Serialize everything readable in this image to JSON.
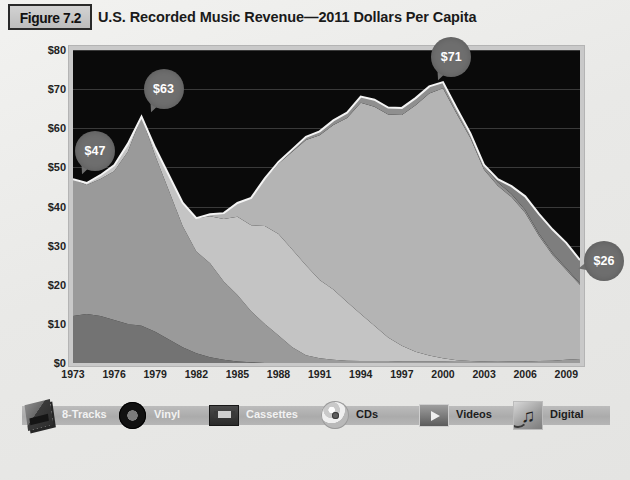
{
  "figure": {
    "badge": "Figure 7.2",
    "title": "U.S. Recorded Music Revenue—2011 Dollars Per Capita"
  },
  "colors": {
    "plot_background": "#0a0a0a",
    "gridline": "#3a3a3a",
    "callout": "#6e6e6e",
    "page_background": "#ebebeb",
    "eight_tracks": "#737373",
    "vinyl": "#9a9a9a",
    "cassettes": "#c4c4c4",
    "cds": "#b4b4b4",
    "videos": "#8f8f8f",
    "digital": "#7e7e7e"
  },
  "legend": {
    "items": [
      {
        "label": "8-Tracks",
        "icon": "eight-track-cartridge-icon",
        "dark": false
      },
      {
        "label": "Vinyl",
        "icon": "vinyl-record-icon",
        "dark": false
      },
      {
        "label": "Cassettes",
        "icon": "cassette-tape-icon",
        "dark": false
      },
      {
        "label": "CDs",
        "icon": "compact-disc-icon",
        "dark": true
      },
      {
        "label": "Videos",
        "icon": "video-play-icon",
        "dark": true
      },
      {
        "label": "Digital",
        "icon": "digital-music-note-icon",
        "dark": true
      }
    ]
  },
  "callouts": [
    {
      "label": "$47",
      "year": 1973,
      "value": 47,
      "tail": "tail-bl"
    },
    {
      "label": "$63",
      "year": 1978,
      "value": 63,
      "tail": "tail-bl"
    },
    {
      "label": "$71",
      "year": 1999,
      "value": 71,
      "tail": "tail-bl"
    },
    {
      "label": "$26",
      "year": 2010,
      "value": 26,
      "tail": "tail-l"
    }
  ],
  "chart_data": {
    "type": "area",
    "stacked": true,
    "title": "U.S. Recorded Music Revenue—2011 Dollars Per Capita",
    "xlabel": "",
    "ylabel": "",
    "grid": true,
    "legend_position": "bottom",
    "xlim": [
      1973,
      2010
    ],
    "ylim": [
      0,
      80
    ],
    "yticks": [
      0,
      10,
      20,
      30,
      40,
      50,
      60,
      70,
      80
    ],
    "ytick_labels": [
      "$0",
      "$10",
      "$20",
      "$30",
      "$40",
      "$50",
      "$60",
      "$70",
      "$80"
    ],
    "xticks": [
      1973,
      1976,
      1979,
      1982,
      1985,
      1988,
      1991,
      1994,
      1997,
      2000,
      2003,
      2006,
      2009
    ],
    "x": [
      1973,
      1974,
      1975,
      1976,
      1977,
      1978,
      1979,
      1980,
      1981,
      1982,
      1983,
      1984,
      1985,
      1986,
      1987,
      1988,
      1989,
      1990,
      1991,
      1992,
      1993,
      1994,
      1995,
      1996,
      1997,
      1998,
      1999,
      2000,
      2001,
      2002,
      2003,
      2004,
      2005,
      2006,
      2007,
      2008,
      2009,
      2010
    ],
    "series": [
      {
        "name": "8-Tracks",
        "color": "#737373",
        "values": [
          12,
          12.5,
          12,
          11,
          10,
          9.5,
          8,
          6,
          4,
          2.5,
          1.5,
          0.8,
          0.4,
          0.2,
          0,
          0,
          0,
          0,
          0,
          0,
          0,
          0,
          0,
          0,
          0,
          0,
          0,
          0,
          0,
          0,
          0,
          0,
          0,
          0,
          0,
          0,
          0,
          0
        ]
      },
      {
        "name": "Vinyl",
        "color": "#9a9a9a",
        "values": [
          35,
          33,
          35,
          38,
          44,
          53.5,
          45,
          38,
          31,
          26,
          24,
          20,
          17,
          13,
          10,
          7,
          4,
          2,
          1.2,
          0.8,
          0.6,
          0.5,
          0.5,
          0.5,
          0.4,
          0.4,
          0.4,
          0.4,
          0.3,
          0.3,
          0.3,
          0.3,
          0.4,
          0.4,
          0.5,
          0.6,
          0.8,
          1.0
        ]
      },
      {
        "name": "Cassettes",
        "color": "#c4c4c4",
        "values": [
          0,
          0.5,
          1,
          1.5,
          2,
          0,
          2,
          4,
          6,
          8.5,
          12,
          16,
          20,
          22,
          25,
          26,
          25,
          23,
          20,
          18,
          15,
          12,
          9,
          6,
          4,
          2.5,
          1.5,
          0.8,
          0.4,
          0.2,
          0.1,
          0,
          0,
          0,
          0,
          0,
          0,
          0
        ]
      },
      {
        "name": "CDs",
        "color": "#b4b4b4",
        "values": [
          0,
          0,
          0,
          0,
          0,
          0,
          0,
          0,
          0,
          0,
          0.5,
          1.5,
          3.5,
          7,
          12,
          18,
          25,
          32,
          37,
          42,
          47,
          54,
          56,
          57,
          59,
          63,
          67,
          69,
          63,
          57,
          49,
          45,
          42,
          38,
          32,
          27,
          23,
          19
        ]
      },
      {
        "name": "Videos",
        "color": "#8f8f8f",
        "values": [
          0,
          0,
          0,
          0,
          0,
          0,
          0,
          0,
          0,
          0,
          0,
          0,
          0,
          0,
          0.2,
          0.4,
          0.6,
          0.8,
          1.0,
          1.2,
          1.4,
          1.6,
          1.8,
          1.8,
          1.8,
          1.8,
          1.8,
          1.6,
          1.4,
          1.2,
          1.0,
          0.9,
          0.8,
          0.7,
          0.6,
          0.5,
          0.4,
          0.3
        ]
      },
      {
        "name": "Digital",
        "color": "#7e7e7e",
        "values": [
          0,
          0,
          0,
          0,
          0,
          0,
          0,
          0,
          0,
          0,
          0,
          0,
          0,
          0,
          0,
          0,
          0,
          0,
          0,
          0,
          0,
          0,
          0,
          0,
          0,
          0,
          0,
          0,
          0,
          0,
          0.2,
          0.8,
          2.0,
          3.5,
          5.0,
          6.0,
          6.5,
          6.0
        ]
      }
    ],
    "totals": [
      47,
      46,
      48,
      50.5,
      56,
      63,
      55,
      48,
      41,
      37,
      38,
      38.3,
      40.9,
      42.2,
      47.2,
      51.4,
      54.6,
      57.8,
      59.2,
      62,
      64,
      68.1,
      67.3,
      65.3,
      65.2,
      67.7,
      70.7,
      71.8,
      65.1,
      58.7,
      50.6,
      47,
      45.2,
      42.6,
      38.1,
      34.1,
      30.7,
      26.3
    ],
    "annotations": [
      {
        "text": "$47",
        "x": 1973,
        "y": 47
      },
      {
        "text": "$63",
        "x": 1978,
        "y": 63
      },
      {
        "text": "$71",
        "x": 1999,
        "y": 71
      },
      {
        "text": "$26",
        "x": 2010,
        "y": 26
      }
    ]
  }
}
